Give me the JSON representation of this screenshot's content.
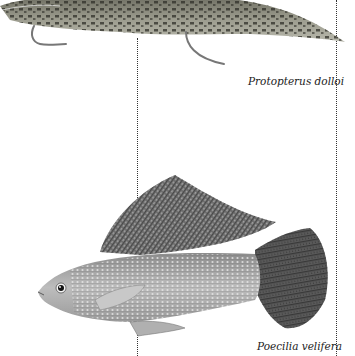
{
  "figures": [
    {
      "id": "lungfish",
      "caption": "Protopterus dolloi",
      "illustration": "spotted-lungfish-illustration"
    },
    {
      "id": "molly",
      "caption": "Poecilia velifera",
      "illustration": "sailfin-molly-illustration"
    }
  ],
  "colors": {
    "background": "#ffffff",
    "dotted_rule": "#333333",
    "caption_text": "#222222"
  }
}
